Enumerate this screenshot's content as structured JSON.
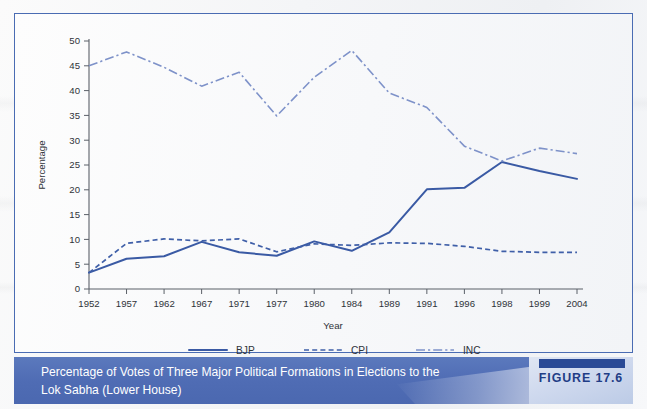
{
  "figure": {
    "tag": "FIGURE 17.6",
    "caption_line1": "Percentage of Votes of Three Major Political Formations in Elections to the",
    "caption_line2": "Lok Sabha (Lower House)"
  },
  "colors": {
    "frame_border": "#4a6cb3",
    "caption_bar": "#4f6cb4",
    "bjp": "#3a5aa4",
    "cpi": "#3f5fa8",
    "inc": "#7e92c9",
    "axis": "#5b6068",
    "tag_text": "#1f3d86"
  },
  "chart_data": {
    "type": "line",
    "title": "",
    "xlabel": "Year",
    "ylabel": "Percentage",
    "ylim": [
      0,
      50
    ],
    "ytick_step": 5,
    "yticks": [
      0,
      5,
      10,
      15,
      20,
      25,
      30,
      35,
      40,
      45,
      50
    ],
    "grid": false,
    "legend_position": "bottom",
    "categories": [
      "1952",
      "1957",
      "1962",
      "1967",
      "1971",
      "1977",
      "1980",
      "1984",
      "1989",
      "1991",
      "1996",
      "1998",
      "1999",
      "2004"
    ],
    "series": [
      {
        "name": "BJP",
        "style": "solid",
        "color": "#3a5aa4",
        "values": [
          3.3,
          6.1,
          6.6,
          9.5,
          7.4,
          6.7,
          9.6,
          7.7,
          11.4,
          20.1,
          20.4,
          25.6,
          23.8,
          22.2
        ]
      },
      {
        "name": "CPI",
        "style": "dotted",
        "color": "#3f5fa8",
        "values": [
          3.3,
          9.2,
          10.1,
          9.7,
          10.1,
          7.5,
          9.1,
          8.8,
          9.3,
          9.2,
          8.6,
          7.6,
          7.4,
          7.4
        ]
      },
      {
        "name": "INC",
        "style": "dash-dot",
        "color": "#7e92c9",
        "values": [
          45.0,
          47.8,
          44.7,
          40.9,
          43.7,
          34.9,
          42.7,
          48.1,
          39.5,
          36.6,
          28.8,
          25.8,
          28.4,
          27.3
        ]
      }
    ]
  }
}
